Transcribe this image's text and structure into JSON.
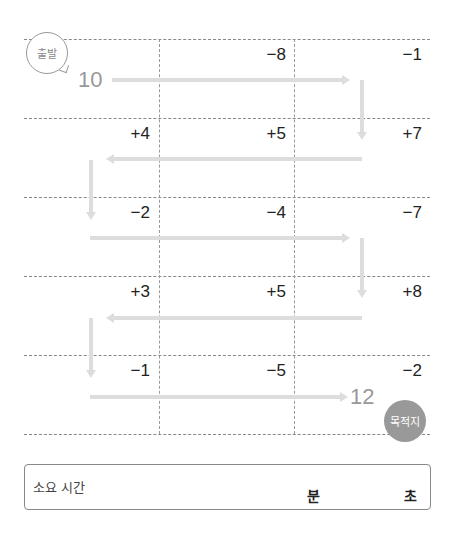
{
  "puzzle": {
    "start": {
      "label": "출발",
      "value": "10"
    },
    "destination": {
      "label": "목적지",
      "value": "12"
    },
    "rows": [
      [
        "",
        "−8",
        "−1"
      ],
      [
        "+4",
        "+5",
        "+7"
      ],
      [
        "−2",
        "−4",
        "−7"
      ],
      [
        "+3",
        "+5",
        "+8"
      ],
      [
        "−1",
        "−5",
        "−2"
      ]
    ]
  },
  "time_box": {
    "label": "소요 시간",
    "minutes_unit": "분",
    "seconds_unit": "초"
  },
  "colors": {
    "arrow": "#dddddd",
    "badge": "#999999",
    "grid": "#888888"
  }
}
